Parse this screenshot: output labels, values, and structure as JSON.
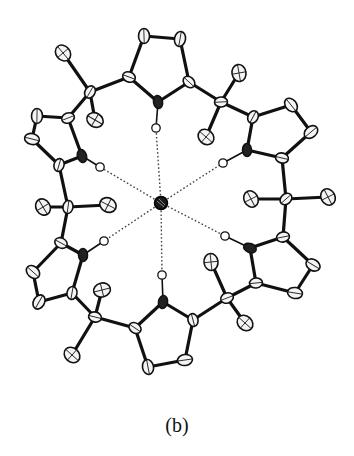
{
  "figure": {
    "caption": "(b)",
    "colors": {
      "ink": "#111111",
      "background": "#ffffff",
      "nitrogen": "#222222",
      "anion": "#1a1a1a"
    },
    "anion": {
      "x": 161,
      "y": 203,
      "r": 6.5
    },
    "pyrroles": [
      {
        "name": "top",
        "N": [
          158,
          102
        ],
        "H": [
          156,
          128
        ],
        "Ca1": [
          129,
          77
        ],
        "Ca2": [
          189,
          82
        ],
        "Cb1": [
          144,
          36
        ],
        "Cb2": [
          180,
          39
        ]
      },
      {
        "name": "upper-left",
        "N": [
          82,
          156
        ],
        "H": [
          100,
          167
        ],
        "Ca1": [
          68,
          118
        ],
        "Ca2": [
          59,
          165
        ],
        "Cb1": [
          37,
          116
        ],
        "Cb2": [
          32,
          139
        ]
      },
      {
        "name": "upper-right",
        "N": [
          247,
          150
        ],
        "H": [
          223,
          163
        ],
        "Ca1": [
          253,
          117
        ],
        "Ca2": [
          282,
          158
        ],
        "Cb1": [
          291,
          105
        ],
        "Cb2": [
          311,
          132
        ]
      },
      {
        "name": "lower-left",
        "N": [
          83,
          255
        ],
        "H": [
          104,
          241
        ],
        "Ca1": [
          61,
          243
        ],
        "Ca2": [
          72,
          293
        ],
        "Cb1": [
          33,
          272
        ],
        "Cb2": [
          39,
          302
        ]
      },
      {
        "name": "lower-right",
        "N": [
          250,
          248
        ],
        "H": [
          225,
          236
        ],
        "Ca1": [
          283,
          237
        ],
        "Ca2": [
          256,
          283
        ],
        "Cb1": [
          313,
          265
        ],
        "Cb2": [
          295,
          293
        ]
      },
      {
        "name": "bottom",
        "N": [
          163,
          302
        ],
        "H": [
          162,
          275
        ],
        "Ca1": [
          135,
          328
        ],
        "Ca2": [
          193,
          320
        ],
        "Cb1": [
          148,
          367
        ],
        "Cb2": [
          185,
          360
        ]
      }
    ],
    "meso_carbons": [
      {
        "name": "upper-left",
        "C": [
          90,
          92
        ],
        "Me1": [
          63,
          53
        ],
        "Me2": [
          95,
          120
        ]
      },
      {
        "name": "upper-right",
        "C": [
          221,
          102
        ],
        "Me1": [
          239,
          73
        ],
        "Me2": [
          206,
          137
        ]
      },
      {
        "name": "left",
        "C": [
          68,
          207
        ],
        "Me1": [
          43,
          207
        ],
        "Me2": [
          108,
          205
        ]
      },
      {
        "name": "right",
        "C": [
          286,
          199
        ],
        "Me1": [
          251,
          199
        ],
        "Me2": [
          328,
          197
        ]
      },
      {
        "name": "lower-left",
        "C": [
          95,
          317
        ],
        "Me1": [
          102,
          290
        ],
        "Me2": [
          72,
          355
        ]
      },
      {
        "name": "lower-right",
        "C": [
          227,
          298
        ],
        "Me1": [
          211,
          262
        ],
        "Me2": [
          245,
          323
        ]
      }
    ]
  }
}
